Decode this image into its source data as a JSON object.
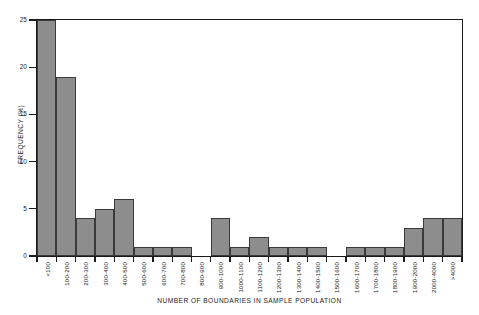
{
  "chart_data": {
    "type": "bar",
    "title": "",
    "xlabel": "NUMBER OF BOUNDARIES IN SAMPLE POPULATION",
    "ylabel": "FREQUENCY (%)",
    "ylim": [
      0,
      25
    ],
    "yticks": [
      0,
      5,
      10,
      15,
      20,
      25
    ],
    "ytick_labels": [
      "0",
      "5",
      "10",
      "15",
      "20",
      "25"
    ],
    "grid": false,
    "legend": null,
    "categories": [
      "<100",
      "100-200",
      "200-300",
      "300-400",
      "400-500",
      "500-600",
      "600-700",
      "700-800",
      "800-900",
      "900-1000",
      "1000-1100",
      "1100-1200",
      "1200-1300",
      "1300-1400",
      "1400-1500",
      "1500-1600",
      "1600-1700",
      "1700-1800",
      "1800-1900",
      "1900-2000",
      "2000-4000",
      ">4000"
    ],
    "values": [
      25,
      19,
      4,
      5,
      6,
      1,
      1,
      1,
      0,
      4,
      1,
      2,
      1,
      1,
      1,
      0,
      1,
      1,
      1,
      3,
      4,
      4
    ],
    "bar_color": "#8d8d8d",
    "bar_edge_color": "#3a3a3a",
    "axis_color": "#1a1a1a",
    "background_color": "#ffffff"
  }
}
